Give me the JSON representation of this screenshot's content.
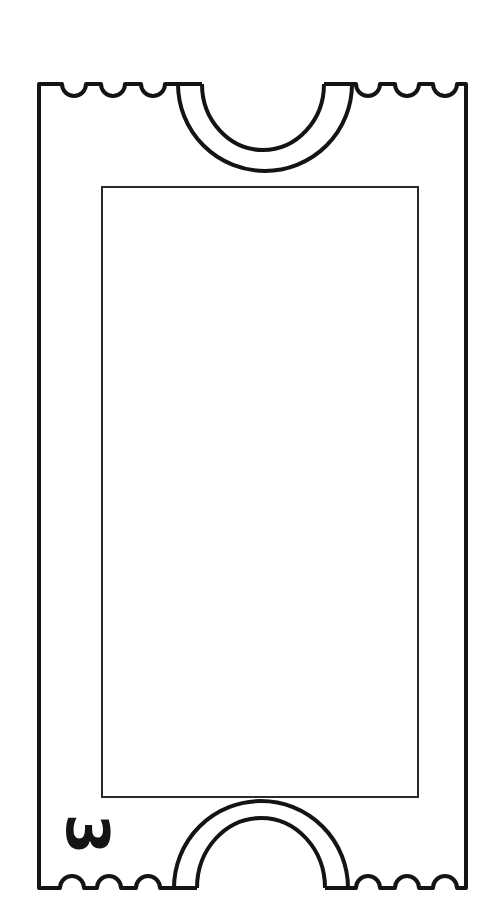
{
  "ticket": {
    "number": "3",
    "stroke_color": "#141414",
    "background_color": "#ffffff",
    "content_area": ""
  }
}
